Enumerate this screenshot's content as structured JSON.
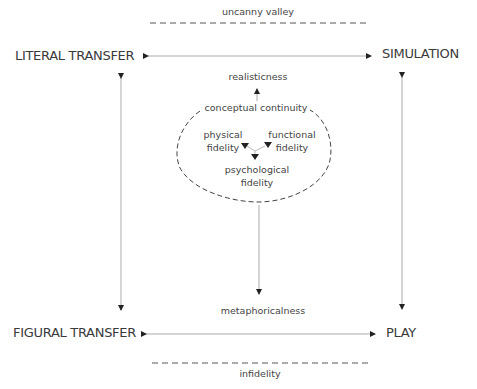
{
  "corners": {
    "top_left": "LITERAL TRANSFER",
    "top_right": "SIMULATION",
    "bottom_left": "FIGURAL TRANSFER",
    "bottom_right": "PLAY"
  },
  "boundaries": {
    "top": "uncanny valley",
    "bottom": "infidelity"
  },
  "axes": {
    "up": "realisticness",
    "down": "metaphoricalness"
  },
  "cluster": {
    "title": "conceptual continuity",
    "physical": [
      "physical",
      "fidelity"
    ],
    "functional": [
      "functional",
      "fidelity"
    ],
    "psychological": [
      "psychological",
      "fidelity"
    ]
  }
}
